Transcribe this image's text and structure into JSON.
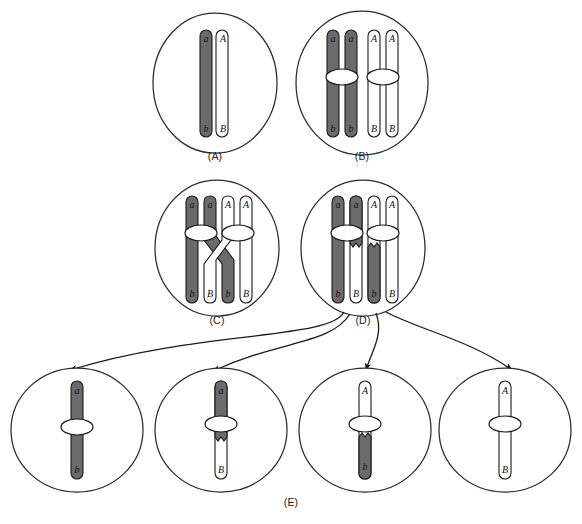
{
  "figure": {
    "type": "biology-diagram",
    "background_color": "#ffffff",
    "chromatid_dark_color": "#6b6b6b",
    "chromatid_light_color": "#ffffff",
    "outline_color": "#1a1a1a",
    "cell_outline_color": "#2a2a2a"
  },
  "panels": [
    {
      "id": "A",
      "label": "(A)",
      "stage_name": "homologous-pair-unreplicated",
      "cell": {
        "cx": 215,
        "cy": 83,
        "rx": 62,
        "ry": 70
      },
      "chromosomes": [
        {
          "name": "maternal-chromosome",
          "shade": "dark",
          "x": 206,
          "top_allele": "a",
          "bottom_allele": "b"
        },
        {
          "name": "paternal-chromosome",
          "shade": "light",
          "x": 224,
          "top_allele": "A",
          "bottom_allele": "B"
        }
      ]
    },
    {
      "id": "B",
      "label": "(B)",
      "stage_name": "replicated-homologues-paired",
      "cell": {
        "cx": 362,
        "cy": 83,
        "rx": 66,
        "ry": 72
      },
      "chromatids": [
        {
          "name": "chromatid-1",
          "shade": "dark",
          "x": 333,
          "top_allele": "a",
          "bottom_allele": "b"
        },
        {
          "name": "chromatid-2",
          "shade": "dark",
          "x": 351,
          "top_allele": "a",
          "bottom_allele": "b"
        },
        {
          "name": "chromatid-3",
          "shade": "light",
          "x": 374,
          "top_allele": "A",
          "bottom_allele": "B"
        },
        {
          "name": "chromatid-4",
          "shade": "light",
          "x": 392,
          "top_allele": "A",
          "bottom_allele": "B"
        }
      ],
      "centromeres": [
        {
          "name": "centromere-dark",
          "cx": 342,
          "cy": 77
        },
        {
          "name": "centromere-light",
          "cx": 383,
          "cy": 77
        }
      ]
    },
    {
      "id": "C",
      "label": "(C)",
      "stage_name": "chiasma-crossing-over",
      "cell": {
        "cx": 217,
        "cy": 248,
        "rx": 62,
        "ry": 68
      },
      "chromatids": [
        {
          "name": "chromatid-1",
          "shade": "dark",
          "x": 192,
          "top_allele": "a",
          "bottom_allele": "b"
        },
        {
          "name": "chromatid-2",
          "shade": "dark",
          "x": 210,
          "top_allele": "a",
          "bottom_allele": "b",
          "crosses": true
        },
        {
          "name": "chromatid-3",
          "shade": "light",
          "x": 228,
          "top_allele": "A",
          "bottom_allele": "B",
          "crosses": true
        },
        {
          "name": "chromatid-4",
          "shade": "light",
          "x": 246,
          "top_allele": "A",
          "bottom_allele": "B"
        }
      ],
      "centromeres": [
        {
          "name": "centromere-dark",
          "cx": 201,
          "cy": 233
        },
        {
          "name": "centromere-light",
          "cx": 238,
          "cy": 233
        }
      ],
      "bottom_alleles": [
        "b",
        "B",
        "b",
        "B"
      ]
    },
    {
      "id": "D",
      "label": "(D)",
      "stage_name": "recombinant-chromatids-after-exchange",
      "cell": {
        "cx": 363,
        "cy": 248,
        "rx": 62,
        "ry": 68
      },
      "chromatids": [
        {
          "name": "chromatid-1",
          "shade": "dark",
          "x": 338,
          "top_allele": "a",
          "bottom_allele": "b",
          "recombinant": false
        },
        {
          "name": "chromatid-2",
          "shade": "dark-top-light-bottom",
          "x": 356,
          "top_allele": "a",
          "bottom_allele": "B",
          "recombinant": true
        },
        {
          "name": "chromatid-3",
          "shade": "light-top-dark-bottom",
          "x": 374,
          "top_allele": "A",
          "bottom_allele": "b",
          "recombinant": true
        },
        {
          "name": "chromatid-4",
          "shade": "light",
          "x": 392,
          "top_allele": "A",
          "bottom_allele": "B",
          "recombinant": false
        }
      ],
      "centromeres": [
        {
          "name": "centromere-dark",
          "cx": 347,
          "cy": 233
        },
        {
          "name": "centromere-light",
          "cx": 383,
          "cy": 233
        }
      ]
    }
  ],
  "gametes": {
    "label": "(E)",
    "stage_name": "four-meiotic-products",
    "cells": [
      {
        "name": "gamete-parental-ab",
        "cx": 77,
        "cy": 430,
        "rx": 66,
        "ry": 62,
        "chromosome": {
          "type": "parental",
          "top_shade": "dark",
          "bottom_shade": "dark",
          "top_allele": "a",
          "bottom_allele": "b"
        }
      },
      {
        "name": "gamete-recombinant-aB",
        "cx": 221,
        "cy": 430,
        "rx": 66,
        "ry": 62,
        "chromosome": {
          "type": "recombinant",
          "top_shade": "dark",
          "bottom_shade": "light",
          "top_allele": "a",
          "bottom_allele": "B"
        }
      },
      {
        "name": "gamete-recombinant-Ab",
        "cx": 365,
        "cy": 430,
        "rx": 66,
        "ry": 62,
        "chromosome": {
          "type": "recombinant",
          "top_shade": "light",
          "bottom_shade": "dark",
          "top_allele": "A",
          "bottom_allele": "b"
        }
      },
      {
        "name": "gamete-parental-AB",
        "cx": 505,
        "cy": 430,
        "rx": 66,
        "ry": 62,
        "chromosome": {
          "type": "parental",
          "top_shade": "light",
          "bottom_shade": "light",
          "top_allele": "A",
          "bottom_allele": "B"
        }
      }
    ]
  },
  "arrows": [
    {
      "name": "arrow-to-gamete-1",
      "from": "panel-D",
      "to": "gamete-parental-ab"
    },
    {
      "name": "arrow-to-gamete-2",
      "from": "panel-D",
      "to": "gamete-recombinant-aB"
    },
    {
      "name": "arrow-to-gamete-3",
      "from": "panel-D",
      "to": "gamete-recombinant-Ab"
    },
    {
      "name": "arrow-to-gamete-4",
      "from": "panel-D",
      "to": "gamete-parental-AB"
    }
  ],
  "labels": {
    "a": "(A)",
    "b": "(B)",
    "c": "(C)",
    "d": "(D)",
    "e": "(E)"
  }
}
